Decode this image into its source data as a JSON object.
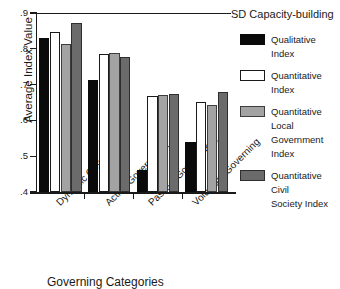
{
  "chart_data": {
    "type": "bar",
    "title": "",
    "xlabel": "Governing Categories",
    "ylabel": "Average Index Value",
    "ylim": [
      0.4,
      0.9
    ],
    "ytick_labels": [
      ".9",
      ".8",
      ".7",
      ".6",
      ".5",
      ".4"
    ],
    "ytick_values": [
      0.9,
      0.8,
      0.7,
      0.6,
      0.5,
      0.4
    ],
    "grid": false,
    "legend_position": "right",
    "legend_title": "SD Capacity-building",
    "categories": [
      "Dynamic Governing",
      "Active Government",
      "Passive Government",
      "Voluntary Governing"
    ],
    "series": [
      {
        "name": "Qualitative Index",
        "color": "#0a0a0a",
        "values": [
          0.83,
          0.713,
          0.462,
          0.541
        ]
      },
      {
        "name": "Quantitative Index",
        "color": "#ffffff",
        "values": [
          0.846,
          0.785,
          0.667,
          0.651
        ]
      },
      {
        "name": "Quantitative Local Government Index",
        "label_lines": [
          "Quantitative Local",
          "Government Index"
        ],
        "color": "#a3a3a3",
        "values": [
          0.814,
          0.789,
          0.67,
          0.642
        ]
      },
      {
        "name": "Quantitative Civil Society Index",
        "label_lines": [
          "Quantitative Civil",
          "Society Index"
        ],
        "color": "#6b6b6b",
        "values": [
          0.872,
          0.778,
          0.673,
          0.678
        ]
      }
    ]
  },
  "axis": {
    "y_title": "Average Index Value",
    "x_title": "Governing Categories"
  },
  "legend": {
    "title": "SD Capacity-building",
    "items": [
      {
        "swatch": "k",
        "lines": [
          "Qualitative Index"
        ]
      },
      {
        "swatch": "w",
        "lines": [
          "Quantitative Index"
        ]
      },
      {
        "swatch": "lg",
        "lines": [
          "Quantitative Local",
          "Government Index"
        ]
      },
      {
        "swatch": "dg",
        "lines": [
          "Quantitative Civil",
          "Society Index"
        ]
      }
    ]
  }
}
